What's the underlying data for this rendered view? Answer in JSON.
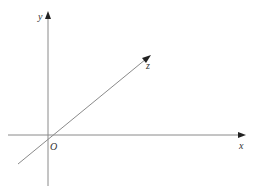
{
  "diagram": {
    "type": "3d-coordinate-axes",
    "origin_label": "O",
    "axes": [
      {
        "name": "x",
        "label": "x"
      },
      {
        "name": "y",
        "label": "y"
      },
      {
        "name": "z",
        "label": "z"
      }
    ],
    "colors": {
      "axis_line": "#8a8a8a",
      "arrow_head": "#222222",
      "label": "#333333",
      "background": "#ffffff"
    }
  }
}
